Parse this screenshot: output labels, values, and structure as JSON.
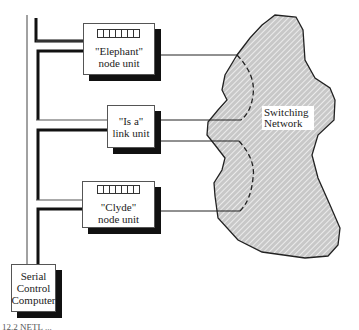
{
  "diagram": {
    "nodes": {
      "elephant": {
        "line1": "\"Elephant\"",
        "line2": "node unit",
        "indicator_cells": 7
      },
      "is_a": {
        "line1": "\"Is a\"",
        "line2": "link unit"
      },
      "clyde": {
        "line1": "\"Clyde\"",
        "line2": "node unit",
        "indicator_cells": 7
      },
      "serial": {
        "line1": "Serial",
        "line2": "Control",
        "line3": "Computer"
      }
    },
    "network": {
      "line1": "Switching",
      "line2": "Network",
      "fill": "#cfcfcf",
      "hatch": "#ffffff"
    },
    "caption": "12.2  NETL ..."
  }
}
